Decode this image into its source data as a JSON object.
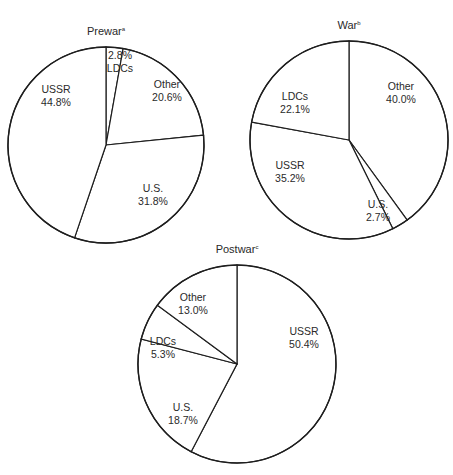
{
  "chart_data": [
    {
      "type": "pie",
      "title": "Prewar",
      "title_superscript": "a",
      "center": [
        106,
        145
      ],
      "radius": 98,
      "start_angle_deg": 0,
      "slices": [
        {
          "label": "LDCs",
          "value": 2.8,
          "display": "2.8%",
          "label_pos": [
            120,
            59
          ],
          "value_first": true
        },
        {
          "label": "Other",
          "value": 20.6,
          "display": "20.6%",
          "label_pos": [
            167,
            88
          ]
        },
        {
          "label": "U.S.",
          "value": 31.8,
          "display": "31.8%",
          "label_pos": [
            153,
            192
          ]
        },
        {
          "label": "USSR",
          "value": 44.8,
          "display": "44.8%",
          "label_pos": [
            56,
            93
          ]
        }
      ]
    },
    {
      "type": "pie",
      "title": "War",
      "title_superscript": "b",
      "center": [
        349,
        140
      ],
      "radius": 99,
      "start_angle_deg": 0,
      "slices": [
        {
          "label": "Other",
          "value": 40.0,
          "display": "40.0%",
          "label_pos": [
            401,
            90
          ]
        },
        {
          "label": "U.S.",
          "value": 2.7,
          "display": "2.7%",
          "label_pos": [
            378,
            208
          ]
        },
        {
          "label": "USSR",
          "value": 35.2,
          "display": "35.2%",
          "label_pos": [
            290,
            169
          ]
        },
        {
          "label": "LDCs",
          "value": 22.1,
          "display": "22.1%",
          "label_pos": [
            295,
            100
          ]
        }
      ]
    },
    {
      "type": "pie",
      "title": "Postwar",
      "title_superscript": "c",
      "center": [
        237,
        364
      ],
      "radius": 99,
      "start_angle_deg": 0,
      "slices": [
        {
          "label": "USSR",
          "value": 50.4,
          "display": "50.4%",
          "label_pos": [
            304,
            335
          ]
        },
        {
          "label": "U.S.",
          "value": 18.7,
          "display": "18.7%",
          "label_pos": [
            183,
            411
          ]
        },
        {
          "label": "LDCs",
          "value": 5.3,
          "display": "5.3%",
          "label_pos": [
            163,
            345
          ]
        },
        {
          "label": "Other",
          "value": 13.0,
          "display": "13.0%",
          "label_pos": [
            193,
            301
          ]
        }
      ]
    }
  ],
  "titles": {
    "prewar": "Prewar",
    "war": "War",
    "postwar": "Postwar"
  }
}
